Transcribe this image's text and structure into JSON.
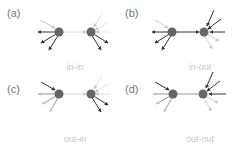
{
  "figure": {
    "panels": [
      {
        "id": "a",
        "tag": "(a)",
        "caption": "in-in"
      },
      {
        "id": "b",
        "tag": "(b)",
        "caption": "in-out"
      },
      {
        "id": "c",
        "tag": "(c)",
        "caption": "out-in"
      },
      {
        "id": "d",
        "tag": "(d)",
        "caption": "out-out"
      }
    ],
    "colors": {
      "node": "#666666",
      "strong_edge": "#333333",
      "faint_edge": "#c8c8c8",
      "caption": "#c8c8c8",
      "tag": "#777777"
    }
  }
}
